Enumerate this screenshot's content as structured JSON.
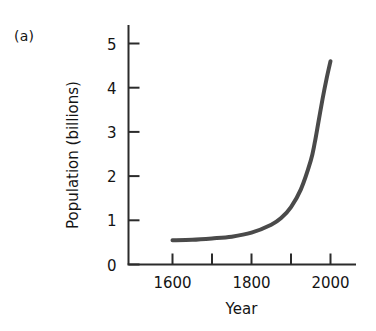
{
  "panel": {
    "label": "(a)"
  },
  "colors": {
    "axis": "#2b2b2b",
    "curve": "#4a4a4a",
    "text": "#141414",
    "background": "#ffffff"
  },
  "chart_data": {
    "type": "line",
    "title": "",
    "xlabel": "Year",
    "ylabel": "Population (billions)",
    "xlim": [
      1500,
      2060
    ],
    "ylim": [
      0,
      5.4
    ],
    "grid": false,
    "legend": null,
    "x_ticks": [
      1600,
      1700,
      1800,
      1900,
      2000
    ],
    "x_tick_labels": [
      "1600",
      "",
      "1800",
      "",
      "2000"
    ],
    "y_ticks": [
      0,
      1,
      2,
      3,
      4,
      5
    ],
    "y_tick_labels": [
      "0",
      "1",
      "2",
      "3",
      "4",
      "5"
    ],
    "series": [
      {
        "name": "World population",
        "x": [
          1600,
          1650,
          1700,
          1750,
          1800,
          1850,
          1875,
          1900,
          1925,
          1950,
          1960,
          1970,
          1980,
          1990,
          2000
        ],
        "values": [
          0.55,
          0.56,
          0.59,
          0.63,
          0.72,
          0.9,
          1.05,
          1.3,
          1.7,
          2.35,
          2.75,
          3.25,
          3.75,
          4.2,
          4.6
        ]
      }
    ],
    "annotations": []
  }
}
